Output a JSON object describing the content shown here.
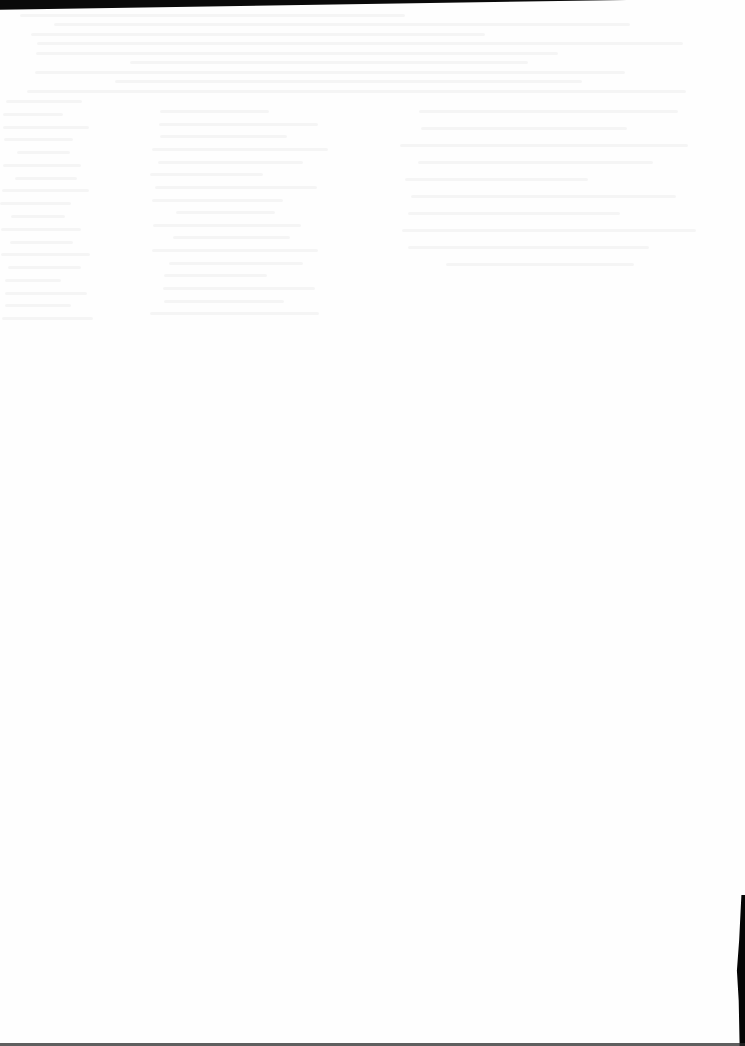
{
  "document": {
    "type": "scanned-page",
    "content": "blank",
    "visible_text": [],
    "bleed_through": {
      "legible": false,
      "regions": [
        {
          "area": "top-band",
          "rows": 9,
          "x": 20,
          "y": 14,
          "w": 700,
          "h": 85
        },
        {
          "area": "left-column",
          "rows": 18,
          "x": 0,
          "y": 100,
          "w": 95,
          "h": 230
        },
        {
          "area": "center-column",
          "rows": 17,
          "x": 150,
          "y": 110,
          "w": 180,
          "h": 215
        },
        {
          "area": "right-column",
          "rows": 10,
          "x": 400,
          "y": 110,
          "w": 300,
          "h": 170
        }
      ]
    },
    "scan_artifacts": {
      "top_border_color": "#0a0a0a",
      "right_edge_color": "#050505",
      "bottom_line_color": "#2a2a2a",
      "paper_color": "#fefefe"
    }
  }
}
